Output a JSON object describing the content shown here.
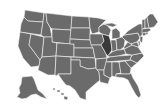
{
  "map": {
    "title": "United States map",
    "colors": {
      "background": "#ffffff",
      "state_fill": "#6b6b6b",
      "highlight_fill": "#3a3a3a",
      "border": "#f2f2f2"
    },
    "highlighted_state": "Illinois",
    "states": [
      {
        "id": "WA",
        "name": "Washington",
        "points": "25,10 44,13 43,22 28,21 24,17"
      },
      {
        "id": "OR",
        "name": "Oregon",
        "points": "24,17 28,21 43,22 41,35 20,32 21,24"
      },
      {
        "id": "CA",
        "name": "California",
        "points": "20,32 31,34 29,45 40,60 39,66 31,67 23,58 18,46"
      },
      {
        "id": "NV",
        "name": "Nevada",
        "points": "31,34 44,37 42,57 40,60 29,45"
      },
      {
        "id": "ID",
        "name": "Idaho",
        "points": "44,13 46,13 47,22 50,27 52,37 44,37 41,35 43,22"
      },
      {
        "id": "MT",
        "name": "Montana",
        "points": "46,13 72,16 71,30 52,29 50,27 47,22"
      },
      {
        "id": "WY",
        "name": "Wyoming",
        "points": "52,29 71,30 70,44 52,42"
      },
      {
        "id": "UT",
        "name": "Utah",
        "points": "44,37 52,37 52,42 57,43 56,56 42,57"
      },
      {
        "id": "AZ",
        "name": "Arizona",
        "points": "42,57 56,56 55,75 48,75 38,70 39,66 40,60"
      },
      {
        "id": "CO",
        "name": "Colorado",
        "points": "57,43 74,44 74,57 56,56"
      },
      {
        "id": "NM",
        "name": "New Mexico",
        "points": "56,56 71,57 71,74 58,74 57,76 55,75"
      },
      {
        "id": "ND",
        "name": "North Dakota",
        "points": "72,16 89,17 90,28 71,28"
      },
      {
        "id": "SD",
        "name": "South Dakota",
        "points": "71,28 90,28 90,40 70,39"
      },
      {
        "id": "NE",
        "name": "Nebraska",
        "points": "70,39 90,40 93,48 74,48 74,44 70,44"
      },
      {
        "id": "KS",
        "name": "Kansas",
        "points": "74,48 93,48 95,58 74,57"
      },
      {
        "id": "OK",
        "name": "Oklahoma",
        "points": "71,57 95,58 96,68 88,69 80,66 80,60 71,60"
      },
      {
        "id": "TX",
        "name": "Texas",
        "points": "71,60 80,60 80,66 88,69 96,68 99,72 100,80 94,85 86,92 86,100 80,98 75,90 70,86 66,85 62,80 58,74 71,74"
      },
      {
        "id": "MN",
        "name": "Minnesota",
        "points": "89,17 98,18 106,20 99,27 99,32 92,34 90,28"
      },
      {
        "id": "IA",
        "name": "Iowa",
        "points": "90,34 102,34 104,41 101,45 91,45 90,40"
      },
      {
        "id": "MO",
        "name": "Missouri",
        "points": "91,45 101,45 104,50 106,54 107,58 96,59 95,58 93,48"
      },
      {
        "id": "AR",
        "name": "Arkansas",
        "points": "96,59 107,58 106,64 104,70 97,70 96,68"
      },
      {
        "id": "LA",
        "name": "Louisiana",
        "points": "97,70 104,70 104,75 110,78 108,84 100,82 99,72"
      },
      {
        "id": "WI",
        "name": "Wisconsin",
        "points": "99,27 104,24 107,25 111,30 109,36 102,34 99,32"
      },
      {
        "id": "IL",
        "name": "Illinois",
        "points": "102,34 109,36 111,42 112,50 108,56 106,54 104,50 101,45 104,41",
        "highlight": true
      },
      {
        "id": "MI",
        "name": "Michigan",
        "points": "104,24 112,23 117,25 113,27 109,26 M112,30 116,28 120,32 120,38 112,39 112,34"
      },
      {
        "id": "IN",
        "name": "Indiana",
        "points": "111,40 116,40 117,50 112,52 112,50 111,42"
      },
      {
        "id": "OH",
        "name": "Ohio",
        "points": "116,39 122,37 125,40 124,47 120,50 117,50"
      },
      {
        "id": "KY",
        "name": "Kentucky",
        "points": "107,56 112,52 117,50 120,50 124,49 126,54 118,56 110,57"
      },
      {
        "id": "TN",
        "name": "Tennessee",
        "points": "107,58 110,57 118,56 132,55 130,60 106,62"
      },
      {
        "id": "MS",
        "name": "Mississippi",
        "points": "106,62 112,62 112,76 110,78 104,75 104,70"
      },
      {
        "id": "AL",
        "name": "Alabama",
        "points": "112,62 119,62 121,73 116,74 116,77 112,76"
      },
      {
        "id": "GA",
        "name": "Georgia",
        "points": "119,62 125,61 131,68 130,74 121,74"
      },
      {
        "id": "FL",
        "name": "Florida",
        "points": "116,74 121,74 130,74 131,73 133,78 138,86 141,95 139,98 136,95 132,88 128,80 124,78 116,77"
      },
      {
        "id": "SC",
        "name": "South Carolina",
        "points": "125,61 131,60 137,63 131,68"
      },
      {
        "id": "NC",
        "name": "North Carolina",
        "points": "130,60 132,55 142,53 144,56 137,63 131,60"
      },
      {
        "id": "VA",
        "name": "Virginia",
        "points": "124,49 128,47 132,45 138,47 142,53 132,55 126,54"
      },
      {
        "id": "WV",
        "name": "West Virginia",
        "points": "124,47 128,42 131,44 132,45 128,47 124,49"
      },
      {
        "id": "PA",
        "name": "Pennsylvania",
        "points": "122,37 124,35 138,33 140,38 137,42 131,44 128,42 125,40"
      },
      {
        "id": "NY",
        "name": "New York",
        "points": "124,35 128,31 134,27 139,24 142,24 143,33 140,38 138,33"
      },
      {
        "id": "MD",
        "name": "Maryland",
        "points": "131,44 137,42 139,46 138,47 132,45"
      },
      {
        "id": "DE",
        "name": "Delaware",
        "points": "138,41 140,41 140,45 139,46"
      },
      {
        "id": "NJ",
        "name": "New Jersey",
        "points": "140,36 143,37 142,43 140,41"
      },
      {
        "id": "CT",
        "name": "Connecticut",
        "points": "142,33 146,32 146,35 143,36"
      },
      {
        "id": "RI",
        "name": "Rhode Island",
        "points": "146,32 148,32 148,34 146,35"
      },
      {
        "id": "MA",
        "name": "Massachusetts",
        "points": "142,29 149,28 151,30 148,32 142,33"
      },
      {
        "id": "VT",
        "name": "Vermont",
        "points": "142,20 145,19 145,28 142,29"
      },
      {
        "id": "NH",
        "name": "New Hampshire",
        "points": "145,19 147,17 149,28 145,28"
      },
      {
        "id": "ME",
        "name": "Maine",
        "points": "147,17 150,14 153,14 158,22 154,27 149,28"
      },
      {
        "id": "AK",
        "name": "Alaska",
        "points": "22,77 32,76 34,79 38,90 43,94 47,99 41,97 36,94 31,95 27,98 22,99 17,97 20,93 19,88 21,84"
      },
      {
        "id": "HI",
        "name": "Hawaii",
        "points": "53,88 55,88 55,90 53,90 M57,90 60,90 60,92 57,92 M61,93 64,93 64,95 61,95 M64,96 68,97 67,100 64,99"
      }
    ]
  }
}
